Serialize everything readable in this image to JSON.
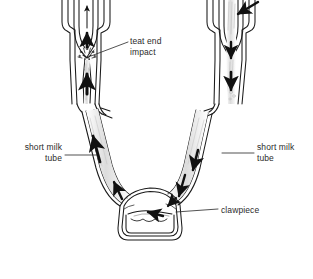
{
  "figure": {
    "background_color": "#ffffff",
    "line_color": "#1a1a1a",
    "text_color": "#2b2b2b",
    "fill_shade_color": "#d8d8d8"
  },
  "labels": {
    "teat_end_impact": "teat end\nimpact",
    "short_milk_tube_left": "short milk\ntube",
    "short_milk_tube_right": "short milk\ntube",
    "clawpiece": "clawpiece"
  },
  "diagram_parts": {
    "left_teat_cup": "left-teat-cup",
    "right_teat_cup": "right-teat-cup",
    "left_short_milk_tube": "left-short-milk-tube",
    "right_short_milk_tube": "right-short-milk-tube",
    "clawpiece_bowl": "clawpiece-bowl",
    "milk_surface": "milk-surface-line"
  },
  "flow_arrows": {
    "left_tube_direction": "upward",
    "right_tube_direction": "downward",
    "claw_inlet_direction": "into-claw",
    "external_inlet_direction": "into-right-teat-cup"
  }
}
